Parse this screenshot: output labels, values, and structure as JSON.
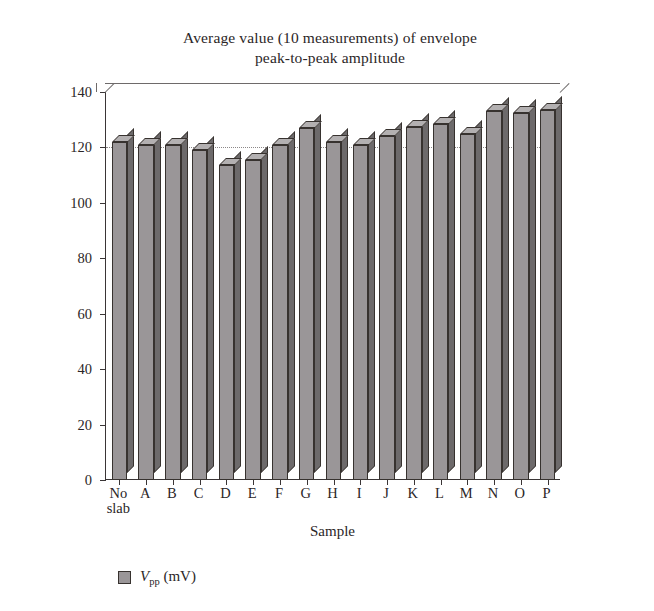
{
  "chart_data": {
    "type": "bar",
    "title": "Average value (10 measurements) of envelope peak-to-peak amplitude",
    "title_lines": [
      "Average value (10 measurements) of envelope",
      "peak-to-peak amplitude"
    ],
    "xlabel": "Sample",
    "ylabel": "Voltage (mV)",
    "ylim": [
      0,
      140
    ],
    "yticks": [
      0,
      20,
      40,
      60,
      80,
      100,
      120,
      140
    ],
    "ytick_labels": [
      "0",
      "20",
      "40",
      "60",
      "80",
      "100",
      "120",
      "140"
    ],
    "grid": "dotted horizontal gridlines at y = 120",
    "gridlines": [
      120
    ],
    "categories": [
      "No slab",
      "A",
      "B",
      "C",
      "D",
      "E",
      "F",
      "G",
      "H",
      "I",
      "J",
      "K",
      "L",
      "M",
      "N",
      "O",
      "P"
    ],
    "category_lines": [
      [
        "No",
        "slab"
      ],
      [
        "A"
      ],
      [
        "B"
      ],
      [
        "C"
      ],
      [
        "D"
      ],
      [
        "E"
      ],
      [
        "F"
      ],
      [
        "G"
      ],
      [
        "H"
      ],
      [
        "I"
      ],
      [
        "J"
      ],
      [
        "K"
      ],
      [
        "L"
      ],
      [
        "M"
      ],
      [
        "N"
      ],
      [
        "O"
      ],
      [
        "P"
      ]
    ],
    "series": [
      {
        "name": "Vpp (mV)",
        "values": [
          122,
          121,
          121,
          119,
          113.5,
          115.5,
          121,
          127,
          122,
          121,
          124,
          127.5,
          128.5,
          125,
          133,
          132.5,
          133.5
        ]
      }
    ],
    "legend": {
      "position": "below-axis-left",
      "entries": [
        {
          "symbol": "V",
          "subscript": "pp",
          "unit": "(mV)",
          "color": "#9a9698"
        }
      ]
    },
    "style": {
      "bar_face_color": "#9a9698",
      "bar_top_color": "#b3b0b1",
      "bar_side_color": "#6d6a6b",
      "bar_edge_color": "#37322f",
      "axis_color": "#3a3536",
      "grid_color": "#8c8888",
      "text_color": "#2b2627",
      "background": "#ffffff",
      "three_d": true
    }
  }
}
